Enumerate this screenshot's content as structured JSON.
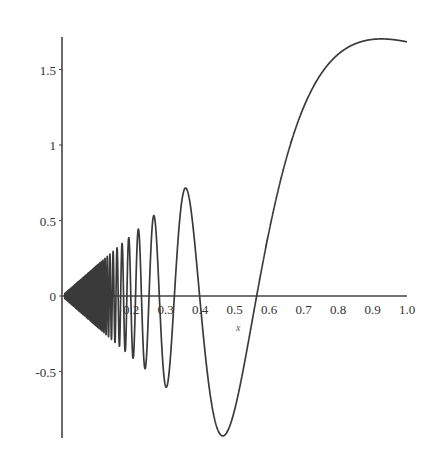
{
  "chart_data": {
    "type": "line",
    "title": "",
    "xlabel": "x",
    "ylabel": "",
    "function": "2*x*sin(1/x^2)",
    "xlim": [
      0,
      1.0
    ],
    "ylim": [
      -0.93,
      1.7
    ],
    "grid": false,
    "legend": null,
    "x_ticks": [
      "0.2",
      "0.3",
      "0.4",
      "0.5",
      "0.6",
      "0.7",
      "0.8",
      "0.9",
      "1.0"
    ],
    "y_ticks": [
      "1.5",
      "1",
      "0.5",
      "0",
      "-0.5"
    ],
    "series": [
      {
        "name": "f(x)",
        "color": "#3a3a3a",
        "x": [
          0.05,
          0.1,
          0.15,
          0.2,
          0.25,
          0.3,
          0.326,
          0.36,
          0.4,
          0.46,
          0.5,
          0.564,
          0.6,
          0.7,
          0.8,
          0.9,
          1.0
        ],
        "values": [
          0.0,
          -0.1,
          -0.22,
          0.0,
          -0.14,
          -0.59,
          0.0,
          0.71,
          -0.05,
          -0.92,
          -0.76,
          0.0,
          0.39,
          1.33,
          1.6,
          1.7,
          1.68
        ]
      }
    ]
  },
  "colors": {
    "axis": "#444444",
    "curve": "#3a3a3a",
    "background": "#ffffff"
  }
}
